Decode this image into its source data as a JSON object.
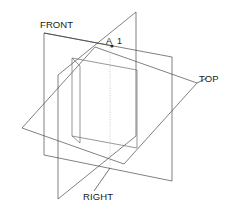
{
  "figure": {
    "background_color": "#ffffff",
    "line_color": "#4a4a4a",
    "hidden_line_color": "#b9b9b9",
    "text_color": "#1a1a1a"
  },
  "labels": {
    "front": "FRONT",
    "top": "TOP",
    "right": "RIGHT",
    "point_letter": "A",
    "point_number": "1"
  },
  "planes": [
    {
      "name": "front",
      "label": "FRONT",
      "orientation": "vertical-frontal"
    },
    {
      "name": "top",
      "label": "TOP",
      "orientation": "horizontal"
    },
    {
      "name": "right",
      "label": "RIGHT",
      "orientation": "vertical-profile"
    }
  ],
  "annotations": [
    {
      "name": "point-a1",
      "text": "A 1",
      "kind": "point-label"
    }
  ]
}
